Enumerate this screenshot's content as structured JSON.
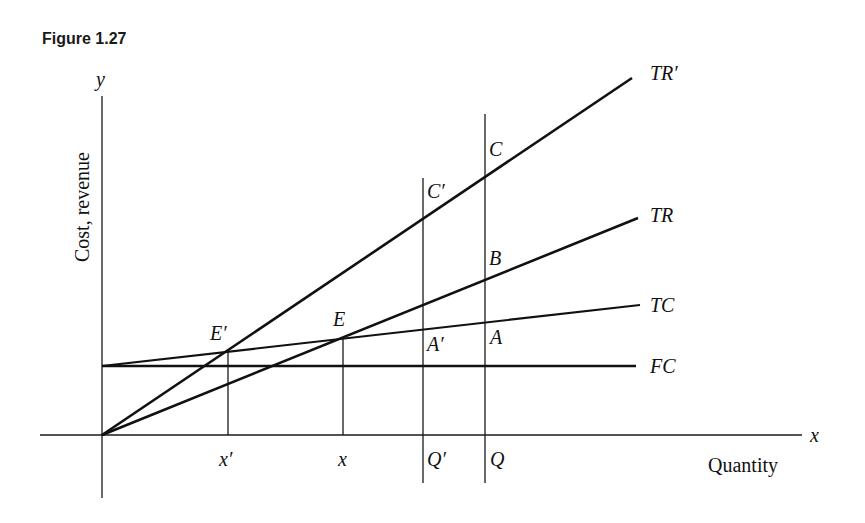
{
  "figure": {
    "title": "Figure 1.27"
  },
  "axes": {
    "y_symbol": "y",
    "x_symbol": "x",
    "y_label": "Cost, revenue",
    "x_label": "Quantity"
  },
  "curves": {
    "tr_prime": "TR′",
    "tr": "TR",
    "tc": "TC",
    "fc": "FC"
  },
  "points": {
    "c": "C",
    "c_prime": "C′",
    "b": "B",
    "a": "A",
    "a_prime": "A′",
    "e": "E",
    "e_prime": "E′"
  },
  "ticks": {
    "x_prime": "x′",
    "x": "x",
    "q_prime": "Q′",
    "q": "Q"
  }
}
